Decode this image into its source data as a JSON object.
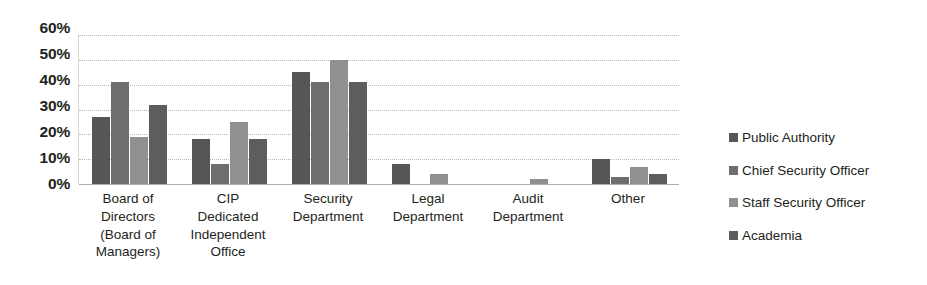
{
  "chart_data": {
    "type": "bar",
    "title": "",
    "subtitle": "",
    "xlabel": "",
    "ylabel": "",
    "ylim": [
      0,
      60
    ],
    "ytick_values": [
      60,
      50,
      40,
      30,
      20,
      10,
      0
    ],
    "ytick_labels": [
      "60%",
      "50%",
      "40%",
      "30%",
      "20%",
      "10%",
      "0%"
    ],
    "grid": true,
    "grid_axis": "y",
    "legend_position": "right",
    "categories": [
      "Board of Directors (Board of Managers)",
      "CIP Dedicated Independent Office",
      "Security Department",
      "Legal Department",
      "Audit Department",
      "Other"
    ],
    "category_label_lines": [
      [
        "Board of",
        "Directors",
        "(Board of",
        "Managers)"
      ],
      [
        "CIP",
        "Dedicated",
        "Independent",
        "Office"
      ],
      [
        "Security",
        "Department"
      ],
      [
        "Legal",
        "Department"
      ],
      [
        "Audit",
        "Department"
      ],
      [
        "Other"
      ]
    ],
    "series": [
      {
        "name": "Public Authority",
        "color": "#565656",
        "values": [
          27,
          18,
          45,
          8,
          0,
          10
        ]
      },
      {
        "name": "Chief Security Officer",
        "color": "#6e6e6e",
        "values": [
          41,
          8,
          41,
          0,
          0,
          3
        ]
      },
      {
        "name": "Staff Security Officer",
        "color": "#909090",
        "values": [
          19,
          25,
          50,
          4,
          2,
          7
        ]
      },
      {
        "name": "Academia",
        "color": "#5d5d5d",
        "values": [
          32,
          18,
          41,
          0,
          0,
          4
        ]
      }
    ]
  }
}
